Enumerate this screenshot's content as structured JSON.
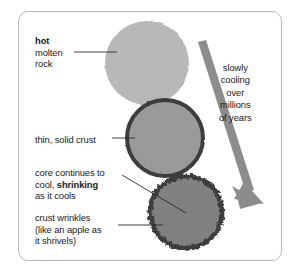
{
  "diagram": {
    "frame": {
      "border_color": "#b9b9b9"
    },
    "colors": {
      "molten_fill": "#b8b8b8",
      "crust_fill": "#9a9a9a",
      "core_fill": "#808080",
      "crust_border": "#3d3d3d",
      "arrow": "#8c8c8c",
      "leader_line": "#2b2b2b",
      "text": "#1a1a1a"
    },
    "stages": [
      {
        "id": "molten-rock",
        "label_lines": [
          {
            "text": "hot",
            "bold": true
          },
          {
            "text": "molten",
            "bold": false
          },
          {
            "text": "rock",
            "bold": false
          }
        ],
        "fill": "#b8b8b8",
        "has_crust": false,
        "wrinkled": false
      },
      {
        "id": "thin-solid-crust",
        "label_lines": [
          {
            "text": "thin, solid crust",
            "bold": false
          }
        ],
        "fill": "#9a9a9a",
        "has_crust": true,
        "wrinkled": false
      },
      {
        "id": "shrinking-core",
        "label_lines": [
          {
            "text": "core continues to",
            "bold": false
          },
          {
            "text": "cool, ",
            "bold": false,
            "bold_tail": "shrinking"
          },
          {
            "text": "as it cools",
            "bold": false
          }
        ],
        "fill": "#808080",
        "has_crust": true,
        "wrinkled": true
      },
      {
        "id": "crust-wrinkles",
        "label_lines": [
          {
            "text": "crust wrinkles",
            "bold": false
          },
          {
            "text": "(like an apple as",
            "bold": false
          },
          {
            "text": "it shrivels)",
            "bold": false
          }
        ]
      }
    ],
    "arrow": {
      "label_lines": [
        "slowly",
        "cooling",
        "over",
        "millions",
        "of years"
      ],
      "direction": "down-right",
      "color": "#8c8c8c"
    },
    "labels": {
      "hot_l1": "hot",
      "hot_l2": "molten",
      "hot_l3": "rock",
      "crust_l1": "thin, solid crust",
      "core_l1": "core continues to",
      "core_l2a": "cool, ",
      "core_l2b": "shrinking",
      "core_l3": "as it cools",
      "wrinkle_l1": "crust wrinkles",
      "wrinkle_l2": "(like an apple as",
      "wrinkle_l3": "it shrivels)",
      "arrow_l1": "slowly",
      "arrow_l2": "cooling",
      "arrow_l3": "over",
      "arrow_l4": "millions",
      "arrow_l5": "of years"
    }
  }
}
